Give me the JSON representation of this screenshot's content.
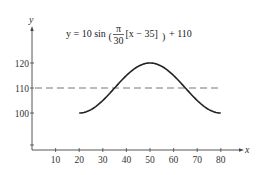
{
  "chart_data": {
    "type": "line",
    "title": "",
    "equation": {
      "lhs": "y = 10 sin",
      "frac_num": "π",
      "frac_den": "30",
      "bracket": "[x − 35]",
      "rhs": "+ 110"
    },
    "xlabel": "x",
    "ylabel": "y",
    "xlim": [
      0,
      85
    ],
    "ylim": [
      95,
      128
    ],
    "x_ticks": [
      10,
      20,
      30,
      40,
      50,
      60,
      70,
      80
    ],
    "y_ticks": [
      100,
      110,
      120
    ],
    "grid": false,
    "legend": null,
    "series": [
      {
        "name": "y = 10 sin(π/30 [x − 35]) + 110",
        "style": "solid",
        "color": "#222222",
        "x": [
          20,
          25,
          30,
          35,
          40,
          45,
          50,
          55,
          60,
          65,
          70,
          75,
          80
        ],
        "values": [
          100,
          100.7,
          102.5,
          105,
          110,
          115,
          118.7,
          120,
          118.7,
          115,
          110,
          105,
          100
        ]
      },
      {
        "name": "y = 110 (midline)",
        "style": "dashed",
        "color": "#777777",
        "x": [
          0,
          85
        ],
        "values": [
          110,
          110
        ]
      }
    ]
  },
  "labels": {
    "x_axis": "x",
    "y_axis": "y",
    "x_ticks": [
      "10",
      "20",
      "30",
      "40",
      "50",
      "60",
      "70",
      "80"
    ],
    "y_ticks": [
      "100",
      "110",
      "120"
    ]
  }
}
